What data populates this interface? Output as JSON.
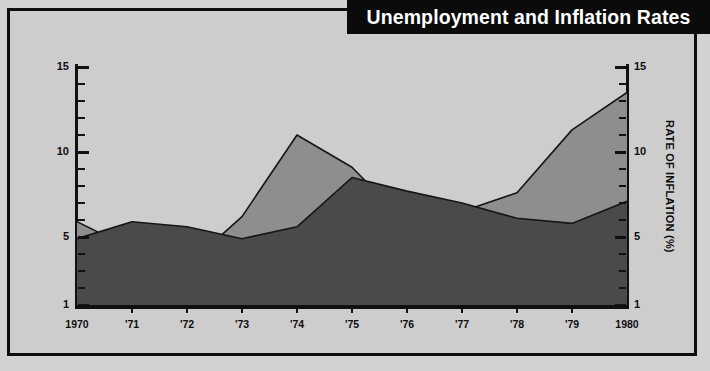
{
  "title": "Unemployment and Inflation Rates",
  "axes": {
    "left_title": "PERCENTAGE OF LABOR FORCE UNEMPLOYED",
    "right_title": "RATE OF INFLATION (%)",
    "y_major_labels": [
      "15",
      "10",
      "5",
      "1"
    ],
    "x_labels": [
      "1970",
      "'71",
      "'72",
      "'73",
      "'74",
      "'75",
      "'76",
      "'77",
      "'78",
      "'79",
      "1980"
    ]
  },
  "colors": {
    "unemployment_fill": "#4a4a4a",
    "inflation_fill": "#8e8e8e",
    "plot_background": "#cdcdcd",
    "page_background": "#d2d2d0",
    "line_stroke": "#161616",
    "banner_background": "#0b0b0b",
    "banner_text": "#ffffff"
  },
  "chart_data": {
    "type": "area",
    "title": "Unemployment and Inflation Rates",
    "xlabel": "",
    "ylabel": "PERCENTAGE OF LABOR FORCE UNEMPLOYED",
    "y2label": "RATE OF INFLATION (%)",
    "ylim": [
      1,
      15
    ],
    "y2lim": [
      1,
      15
    ],
    "ytick_values": [
      1,
      5,
      10,
      15
    ],
    "grid": false,
    "legend": "none",
    "categories": [
      "1970",
      "'71",
      "'72",
      "'73",
      "'74",
      "'75",
      "'76",
      "'77",
      "'78",
      "'79",
      "1980"
    ],
    "x": [
      1970,
      1971,
      1972,
      1973,
      1974,
      1975,
      1976,
      1977,
      1978,
      1979,
      1980
    ],
    "series": [
      {
        "name": "Percentage of labor force unemployed",
        "axis": "left",
        "color": "#4a4a4a",
        "values": [
          4.9,
          5.9,
          5.6,
          4.9,
          5.6,
          8.5,
          7.7,
          7.0,
          6.1,
          5.8,
          7.1
        ]
      },
      {
        "name": "Rate of inflation (%)",
        "axis": "right",
        "color": "#8e8e8e",
        "values": [
          5.9,
          4.3,
          3.3,
          6.2,
          11.0,
          9.1,
          5.8,
          6.5,
          7.6,
          11.3,
          13.5
        ]
      }
    ]
  }
}
